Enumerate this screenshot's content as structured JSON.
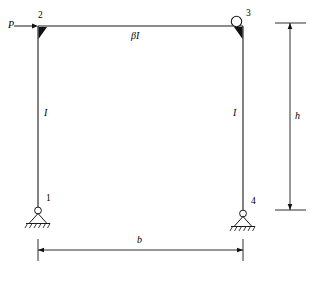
{
  "figure": {
    "type": "structural-frame-diagram"
  },
  "labels": {
    "load": "P",
    "beam_stiffness": "βI",
    "left_column_stiffness": "I",
    "right_column_stiffness": "I",
    "node_1": "1",
    "node_2": "2",
    "node_3": "3",
    "node_4": "4",
    "height_dimension": "h",
    "width_dimension": "b"
  },
  "geometry": {
    "frame_left_x": 38,
    "frame_right_x": 243,
    "frame_top_y": 26,
    "frame_base_y": 208,
    "height_dim_x": 290,
    "width_dim_y": 250
  },
  "colors": {
    "line": "#000000",
    "background": "#ffffff",
    "text": "#000000"
  },
  "elements": {
    "joint_2_type": "rigid-gusset",
    "joint_3_type": "hinge-circle-with-gusset",
    "support_1_type": "pinned",
    "support_4_type": "pinned",
    "load_direction": "right"
  }
}
